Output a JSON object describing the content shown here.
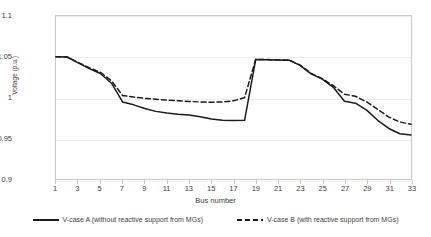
{
  "chart_data": {
    "type": "line",
    "title": "",
    "xlabel": "Bus number",
    "ylabel": "Voltage (p.u.)",
    "xlim": [
      1,
      33
    ],
    "ylim": [
      0.9,
      1.1
    ],
    "grid": true,
    "legend_position": "bottom",
    "y_ticks": [
      "1.1",
      "1.05",
      "1",
      "0.95",
      "0.9"
    ],
    "y_tick_values": [
      1.1,
      1.05,
      1.0,
      0.95,
      0.9
    ],
    "x_ticks": [
      "1",
      "3",
      "5",
      "7",
      "9",
      "11",
      "13",
      "15",
      "17",
      "19",
      "21",
      "23",
      "25",
      "27",
      "29",
      "31",
      "33"
    ],
    "x_tick_values": [
      1,
      3,
      5,
      7,
      9,
      11,
      13,
      15,
      17,
      19,
      21,
      23,
      25,
      27,
      29,
      31,
      33
    ],
    "x": [
      1,
      2,
      3,
      4,
      5,
      6,
      7,
      8,
      9,
      10,
      11,
      12,
      13,
      14,
      15,
      16,
      17,
      18,
      19,
      20,
      21,
      22,
      23,
      24,
      25,
      26,
      27,
      28,
      29,
      30,
      31,
      32,
      33
    ],
    "series": [
      {
        "name": "V-case A (without reactive support from MGs)",
        "style": "solid",
        "color": "#1a1a1a",
        "values": [
          1.05,
          1.0497,
          1.0425,
          1.0355,
          1.0295,
          1.0175,
          0.9945,
          0.991,
          0.9865,
          0.983,
          0.981,
          0.9795,
          0.9785,
          0.9765,
          0.9735,
          0.972,
          0.9718,
          0.972,
          1.0465,
          1.0462,
          1.046,
          1.0458,
          1.0395,
          1.029,
          1.0225,
          1.0125,
          0.9955,
          0.993,
          0.9845,
          0.972,
          0.962,
          0.9555,
          0.954
        ]
      },
      {
        "name": "V-case B (with reactive support from MGs)",
        "style": "dashed",
        "color": "#1a1a1a",
        "values": [
          1.05,
          1.0497,
          1.043,
          1.0365,
          1.031,
          1.0205,
          1.0025,
          1.0005,
          0.999,
          0.9978,
          0.9968,
          0.996,
          0.9952,
          0.9945,
          0.9942,
          0.9945,
          0.996,
          0.9998,
          1.0468,
          1.0465,
          1.0462,
          1.046,
          1.0398,
          1.0295,
          1.023,
          1.0145,
          1.004,
          1.0015,
          0.9945,
          0.9855,
          0.976,
          0.97,
          0.9672
        ]
      }
    ]
  },
  "legend": {
    "entries": [
      {
        "label": "V-case A (without reactive support from MGs)"
      },
      {
        "label": "V-case B (with reactive support from MGs)"
      }
    ]
  }
}
